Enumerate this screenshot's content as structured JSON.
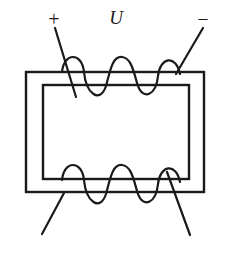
{
  "figure": {
    "kind": "electrical-schematic",
    "background_color": "#ffffff",
    "line_color": "#1a1a1a"
  },
  "labels": {
    "plus_terminal": "+",
    "voltage": "U",
    "minus_terminal": "−"
  },
  "core": {
    "outer_rect": {
      "x": 26,
      "y": 72,
      "width": 178,
      "height": 120
    },
    "inner_rect": {
      "x": 43,
      "y": 85,
      "width": 146,
      "height": 94
    }
  },
  "windings": {
    "primary": {
      "position": "top",
      "turns": 3,
      "x_start": 62,
      "x_end": 180,
      "peak_y": 57,
      "trough_y": 101
    },
    "secondary": {
      "position": "bottom",
      "turns": 3,
      "x_start": 62,
      "x_end": 180,
      "peak_y": 165,
      "trough_y": 209
    }
  },
  "leads": {
    "top_left": {
      "x1": 55,
      "y1": 28,
      "x2": 76,
      "y2": 97
    },
    "top_right": {
      "x1": 203,
      "y1": 28,
      "x2": 176,
      "y2": 74
    },
    "bottom_left": {
      "x1": 64,
      "y1": 193,
      "x2": 42,
      "y2": 234
    },
    "bottom_right": {
      "x1": 167,
      "y1": 172,
      "x2": 190,
      "y2": 235
    }
  },
  "label_positions": {
    "plus": {
      "x": 54,
      "y": 21
    },
    "u": {
      "x": 116,
      "y": 20
    },
    "minus": {
      "x": 203,
      "y": 21
    }
  }
}
